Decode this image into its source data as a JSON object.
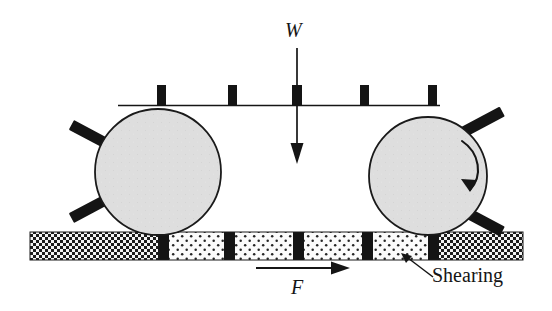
{
  "figure": {
    "width": 552,
    "height": 311,
    "background": "#ffffff"
  },
  "labels": {
    "load": "W",
    "force": "F",
    "shearing": "Shearing"
  },
  "colors": {
    "ink": "#151515",
    "roller_fill": "#dedede",
    "roller_stroke": "#1a1a1a",
    "stud_fill": "#141414",
    "track_dense_fill": "#f2f2f2",
    "track_dense_dot": "#1a1a1a",
    "track_sparse_fill": "#fbfbfb",
    "track_sparse_dot": "#242424",
    "divider_fill": "#141414",
    "page_background": "#ffffff"
  },
  "diagram": {
    "top_bar": {
      "name": "load-beam",
      "x1": 118,
      "x2": 440,
      "y": 105,
      "thickness": 1.6,
      "stud_count": 5,
      "stud_xs": [
        157,
        228,
        292,
        360,
        428
      ],
      "stud_top": 85,
      "stud_height": 21,
      "stud_width": 9
    },
    "rollers": [
      {
        "name": "left-roller",
        "cx": 158,
        "cy": 172,
        "r": 63,
        "rotation_arrow": false,
        "spokes": [
          {
            "angle_deg": 208,
            "length": 26,
            "width": 11
          },
          {
            "angle_deg": 152,
            "length": 26,
            "width": 11
          }
        ]
      },
      {
        "name": "right-roller",
        "cx": 428,
        "cy": 176,
        "r": 59,
        "rotation_arrow": true,
        "spokes": [
          {
            "angle_deg": -28,
            "length": 25,
            "width": 11
          },
          {
            "angle_deg": 30,
            "length": 25,
            "width": 11
          }
        ]
      }
    ],
    "track": {
      "name": "layered-track",
      "x": 30,
      "y": 232,
      "width": 493,
      "height": 28,
      "segments": [
        {
          "type": "dense",
          "x": 30,
          "width": 128
        },
        {
          "type": "divider",
          "x": 158,
          "width": 11
        },
        {
          "type": "sparse",
          "x": 169,
          "width": 55
        },
        {
          "type": "divider",
          "x": 224,
          "width": 11
        },
        {
          "type": "sparse",
          "x": 235,
          "width": 58
        },
        {
          "type": "divider",
          "x": 293,
          "width": 11
        },
        {
          "type": "sparse",
          "x": 304,
          "width": 58
        },
        {
          "type": "divider",
          "x": 362,
          "width": 11
        },
        {
          "type": "sparse",
          "x": 373,
          "width": 55
        },
        {
          "type": "divider",
          "x": 428,
          "width": 11
        },
        {
          "type": "dense",
          "x": 439,
          "width": 84
        }
      ]
    },
    "arrows": {
      "load_arrow": {
        "name": "load-arrow-w",
        "x": 297,
        "y_start": 48,
        "y_end": 162,
        "head_width": 13,
        "head_length": 17,
        "direction": "down"
      },
      "force_arrow": {
        "name": "force-arrow-f",
        "y": 268,
        "x_start": 256,
        "x_end": 348,
        "head_width": 12,
        "head_length": 16,
        "direction": "right"
      },
      "shearing_pointer": {
        "name": "shearing-pointer-arrow",
        "tip_x": 402,
        "tip_y": 254,
        "tail_x": 433,
        "tail_y": 275
      },
      "rotation_arrow": {
        "name": "rotation-arrow",
        "direction": "clockwise",
        "start_x": 469,
        "start_y": 142,
        "end_x": 466,
        "end_y": 192
      }
    }
  }
}
